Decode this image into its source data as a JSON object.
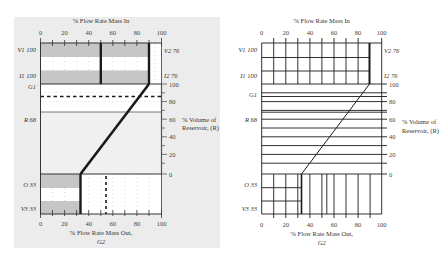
{
  "figure": {
    "left_panel": {
      "top_axis_title": "% Flow Rate Mass In",
      "bottom_axis_title_line1": "% Flow Rate Mass Out,",
      "bottom_axis_title_line2": "G2",
      "right_axis_title_line1": "% Volume of",
      "right_axis_title_line2": "Reservoir, (R)",
      "x_ticks": [
        "0",
        "20",
        "40",
        "60",
        "80",
        "100"
      ],
      "right_ticks": [
        "100",
        "80",
        "60",
        "40",
        "20",
        "0"
      ],
      "left_labels": {
        "v1": "V1 100",
        "i1": "I1 100",
        "g1": "G1",
        "r": "R 68",
        "o": "O 33",
        "v3": "V3 33"
      },
      "right_labels": {
        "v2": "V2 76",
        "i2": "I2 76"
      }
    },
    "right_panel": {
      "top_axis_title": "% Flow Rate Mass In",
      "bottom_axis_title_line1": "% Flow Rate Mass Out,",
      "bottom_axis_title_line2": "G2",
      "right_axis_title_line1": "% Volume of",
      "right_axis_title_line2": "Reservoir, (R)",
      "x_ticks": [
        "0",
        "20",
        "40",
        "60",
        "80",
        "100"
      ],
      "right_ticks": [
        "100",
        "80",
        "60",
        "40",
        "20",
        "0"
      ],
      "left_labels": {
        "v1": "V1 100",
        "i1": "I1 100",
        "g1": "G1",
        "r": "R 68",
        "o": "O 33",
        "v3": "V3 33"
      },
      "right_labels": {
        "v2": "V2 76",
        "i2": "I2 76"
      }
    },
    "values": {
      "inflow_limit_pct": 90,
      "inflow_split_pct": 50,
      "g1_volume_pct": 86,
      "reservoir_r_pct": 68,
      "outflow_pct": 33,
      "outflow_dashed_pct": 54
    },
    "colors": {
      "panel_bg": "#ececec",
      "band_gray": "#c6c6c6",
      "line": "#1a1a1a",
      "reservoir_fill": "#f0f0f0"
    }
  }
}
